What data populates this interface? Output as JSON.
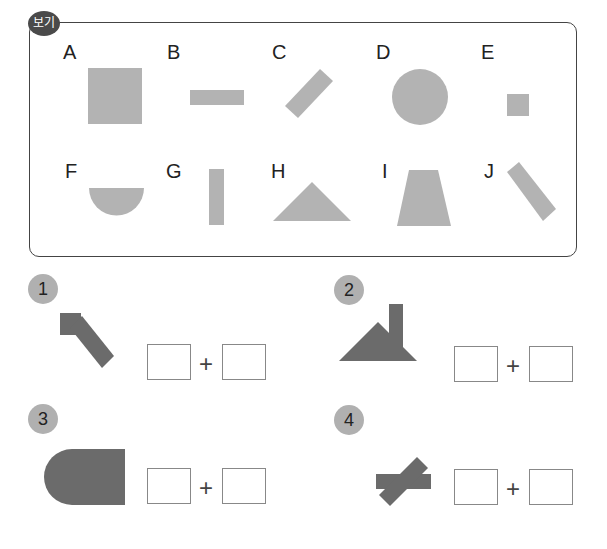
{
  "header": {
    "tag_label": "보기"
  },
  "options": [
    {
      "letter": "A",
      "shape": "large square"
    },
    {
      "letter": "B",
      "shape": "horizontal rectangle"
    },
    {
      "letter": "C",
      "shape": "rectangle tilted up-right"
    },
    {
      "letter": "D",
      "shape": "circle"
    },
    {
      "letter": "E",
      "shape": "small square"
    },
    {
      "letter": "F",
      "shape": "half circle"
    },
    {
      "letter": "G",
      "shape": "vertical rectangle"
    },
    {
      "letter": "H",
      "shape": "triangle"
    },
    {
      "letter": "I",
      "shape": "trapezoid"
    },
    {
      "letter": "J",
      "shape": "rectangle tilted down-right"
    }
  ],
  "problems": [
    {
      "number": "1",
      "plus": "+",
      "answer_left": "",
      "answer_right": ""
    },
    {
      "number": "2",
      "plus": "+",
      "answer_left": "",
      "answer_right": ""
    },
    {
      "number": "3",
      "plus": "+",
      "answer_left": "",
      "answer_right": ""
    },
    {
      "number": "4",
      "plus": "+",
      "answer_left": "",
      "answer_right": ""
    }
  ],
  "colors": {
    "light_shape": "#b3b3b3",
    "dark_shape": "#6b6b6b",
    "border": "#444444",
    "badge": "#b0b0b0"
  }
}
